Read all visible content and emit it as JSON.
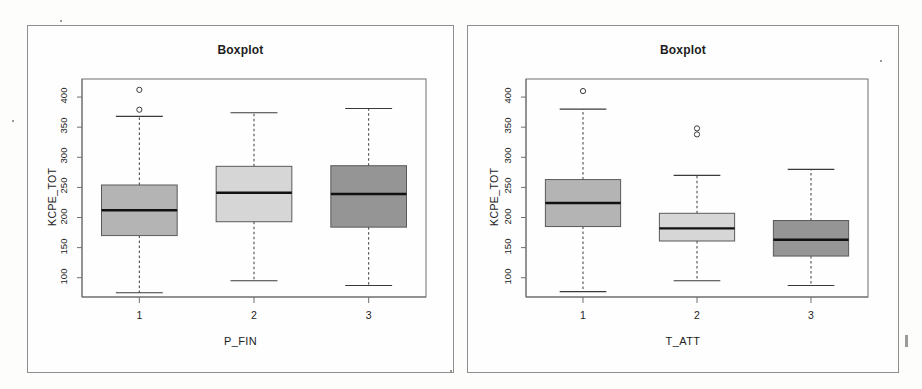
{
  "page": {
    "background_color": "#fdfdfc",
    "frame_color": "#8e8e8e"
  },
  "chart_data": [
    {
      "id": "left",
      "type": "boxplot",
      "title": "Boxplot",
      "xlabel": "P_FIN",
      "ylabel": "KCPE_TOT",
      "categories": [
        "1",
        "2",
        "3"
      ],
      "ytick_labels": [
        "400",
        "350",
        "300",
        "250",
        "200",
        "150",
        "100"
      ],
      "ytick_values": [
        400,
        350,
        300,
        250,
        200,
        150,
        100
      ],
      "ylim": [
        68,
        430
      ],
      "grid": false,
      "legend": "none",
      "box_colors": [
        "#b4b4b4",
        "#d6d6d6",
        "#959595"
      ],
      "boxes": [
        {
          "category": "1",
          "lower_whisker": 75,
          "q1": 170,
          "median": 212,
          "q3": 254,
          "upper_whisker": 368,
          "outliers": [
            412,
            379
          ],
          "fill": "#b4b4b4"
        },
        {
          "category": "2",
          "lower_whisker": 95,
          "q1": 193,
          "median": 241,
          "q3": 285,
          "upper_whisker": 374,
          "outliers": [],
          "fill": "#d6d6d6"
        },
        {
          "category": "3",
          "lower_whisker": 87,
          "q1": 184,
          "median": 239,
          "q3": 286,
          "upper_whisker": 381,
          "outliers": [],
          "fill": "#959595"
        }
      ]
    },
    {
      "id": "right",
      "type": "boxplot",
      "title": "Boxplot",
      "xlabel": "T_ATT",
      "ylabel": "KCPE_TOT",
      "categories": [
        "1",
        "2",
        "3"
      ],
      "ytick_labels": [
        "400",
        "350",
        "300",
        "250",
        "200",
        "150",
        "100"
      ],
      "ytick_values": [
        400,
        350,
        300,
        250,
        200,
        150,
        100
      ],
      "ylim": [
        68,
        430
      ],
      "grid": false,
      "legend": "none",
      "box_colors": [
        "#b4b4b4",
        "#d6d6d6",
        "#959595"
      ],
      "boxes": [
        {
          "category": "1",
          "lower_whisker": 77,
          "q1": 185,
          "median": 224,
          "q3": 263,
          "upper_whisker": 380,
          "outliers": [
            410
          ],
          "fill": "#b4b4b4"
        },
        {
          "category": "2",
          "lower_whisker": 95,
          "q1": 161,
          "median": 182,
          "q3": 207,
          "upper_whisker": 270,
          "outliers": [
            348,
            338
          ],
          "fill": "#d6d6d6"
        },
        {
          "category": "3",
          "lower_whisker": 87,
          "q1": 136,
          "median": 163,
          "q3": 195,
          "upper_whisker": 280,
          "outliers": [],
          "fill": "#959595"
        }
      ]
    }
  ]
}
